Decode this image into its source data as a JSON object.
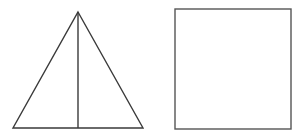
{
  "canvas": {
    "width": 300,
    "height": 140,
    "background_color": "#ffffff"
  },
  "figure": {
    "stroke_color": "#3a3a3a",
    "stroke_color_light": "#555555",
    "stroke_width": 1.4,
    "fill_color": "none"
  },
  "shapes": [
    {
      "name": "triangle",
      "type": "polygon",
      "label": "Triangle",
      "points": "78,12 143,128 13,128",
      "apex": {
        "x": 78,
        "y": 12
      },
      "base_left": {
        "x": 13,
        "y": 128
      },
      "base_right": {
        "x": 143,
        "y": 128
      },
      "base_length": 130,
      "height": 116
    },
    {
      "name": "triangle-altitude",
      "type": "line",
      "label": "Altitude",
      "x1": 78,
      "y1": 12,
      "x2": 78,
      "y2": 128
    },
    {
      "name": "square",
      "type": "rect",
      "label": "Square",
      "x": 175,
      "y": 9,
      "width": 116,
      "height": 120
    }
  ]
}
